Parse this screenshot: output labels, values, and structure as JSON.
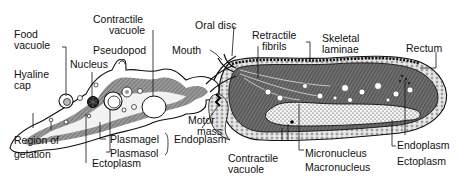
{
  "figure": {
    "panels": [
      {
        "id": "amoeba",
        "labels": {
          "contractile_vacuole_1": "Contractile",
          "contractile_vacuole_2": "vacuole",
          "food_vacuole_1": "Food",
          "food_vacuole_2": "vacuole",
          "pseudopod": "Pseudopod",
          "nucleus": "Nucleus",
          "hyaline_cap_1": "Hyaline",
          "hyaline_cap_2": "cap",
          "region_gelation_1": "Region of",
          "region_gelation_2": "gelation",
          "plasmagel": "Plasmagel",
          "plasmasol": "Plasmasol",
          "endoplasm": "Endoplasm",
          "ectoplasm": "Ectoplasm"
        }
      },
      {
        "id": "ciliate",
        "labels": {
          "oral_disc": "Oral disc",
          "mouth": "Mouth",
          "retractile_fibrils_1": "Retractile",
          "retractile_fibrils_2": "fibrils",
          "skeletal_laminae_1": "Skeletal",
          "skeletal_laminae_2": "laminae",
          "rectum": "Rectum",
          "motor_mass_1": "Motor",
          "motor_mass_2": "mass",
          "endoplasm": "Endoplasm",
          "ectoplasm": "Ectoplasm",
          "contractile_vacuole_1": "Contractile",
          "contractile_vacuole_2": "vacuole",
          "micronucleus": "Micronucleus",
          "macronucleus": "Macronucleus"
        }
      }
    ]
  }
}
